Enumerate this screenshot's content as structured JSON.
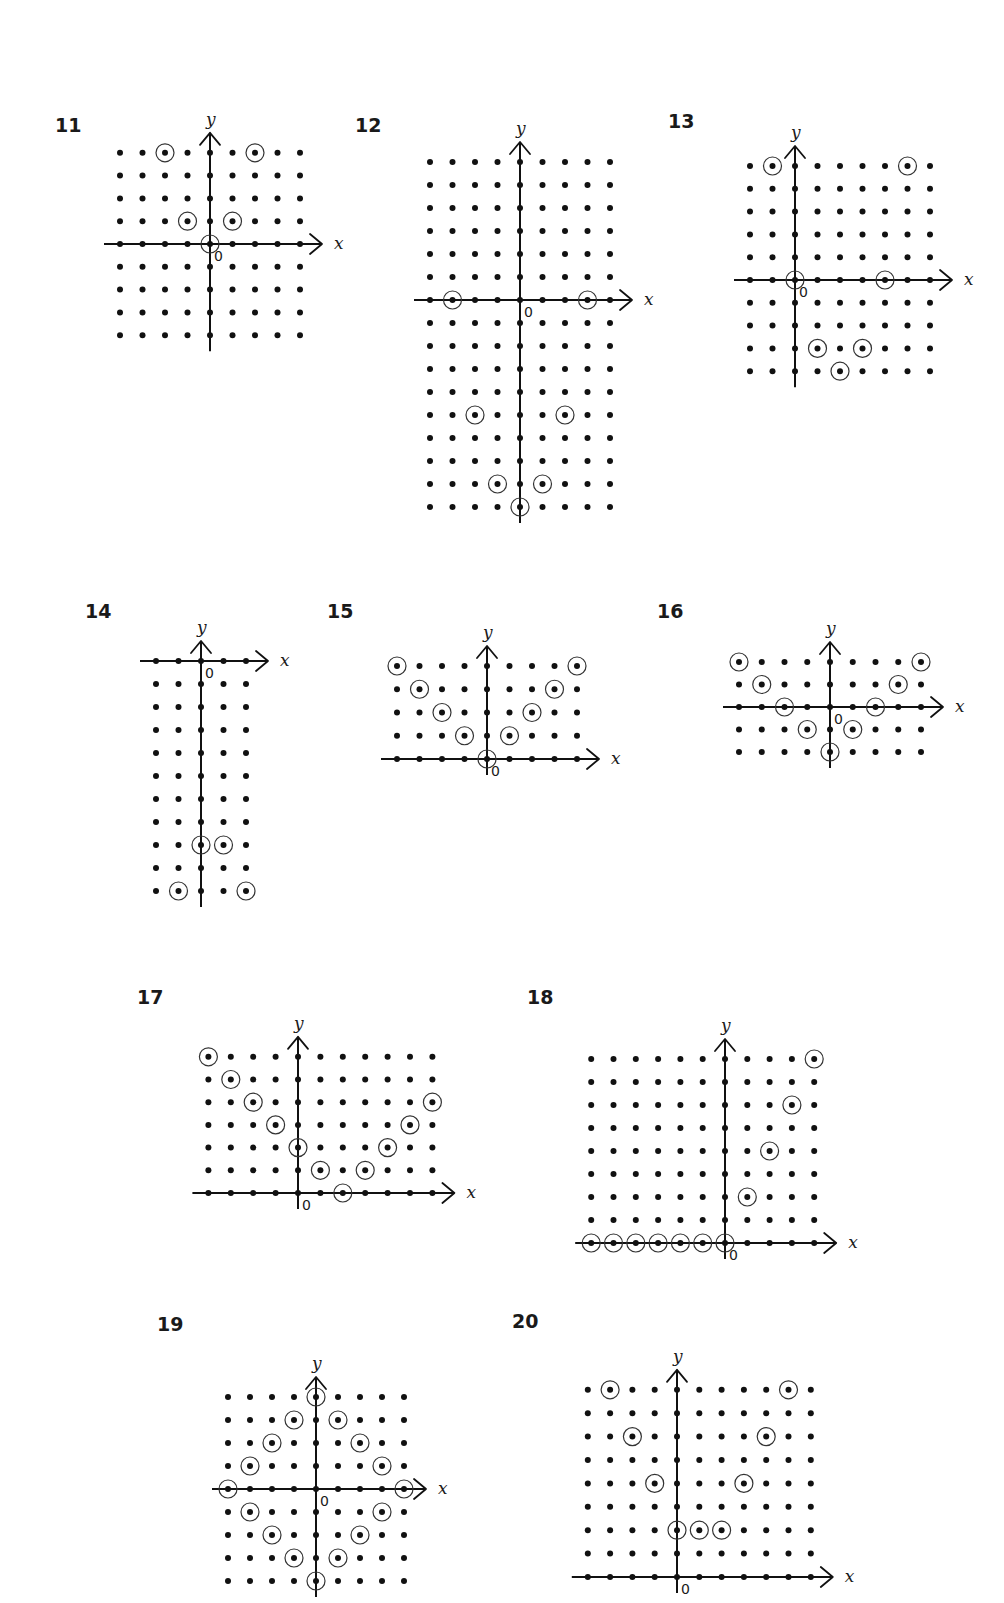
{
  "style": {
    "dot_color": "#111111",
    "ring_color": "#333333",
    "axis_color": "#111111",
    "background": "#ffffff"
  },
  "labels": {
    "x_axis": "x",
    "y_axis": "y",
    "origin": "0"
  },
  "diagrams": [
    {
      "number": "11",
      "label_pos": [
        55,
        132
      ],
      "origin_px": [
        210,
        244
      ],
      "spacing": [
        22.5,
        22.8
      ],
      "x_range": [
        -4,
        4
      ],
      "y_range": [
        -4,
        4
      ],
      "circled": [
        [
          -2,
          4
        ],
        [
          2,
          4
        ],
        [
          -1,
          1
        ],
        [
          1,
          1
        ],
        [
          0,
          0
        ]
      ]
    },
    {
      "number": "12",
      "label_pos": [
        355,
        132
      ],
      "origin_px": [
        520,
        300
      ],
      "spacing": [
        22.5,
        23
      ],
      "x_range": [
        -4,
        4
      ],
      "y_range": [
        -9,
        6
      ],
      "circled": [
        [
          -3,
          0
        ],
        [
          3,
          0
        ],
        [
          -2,
          -5
        ],
        [
          2,
          -5
        ],
        [
          -1,
          -8
        ],
        [
          1,
          -8
        ],
        [
          0,
          -9
        ]
      ]
    },
    {
      "number": "13",
      "label_pos": [
        668,
        128
      ],
      "origin_px": [
        795,
        280
      ],
      "spacing": [
        22.5,
        22.8
      ],
      "x_range": [
        -2,
        6
      ],
      "y_range": [
        -4,
        5
      ],
      "circled": [
        [
          -1,
          5
        ],
        [
          5,
          5
        ],
        [
          0,
          0
        ],
        [
          4,
          0
        ],
        [
          1,
          -3
        ],
        [
          3,
          -3
        ],
        [
          2,
          -4
        ]
      ]
    },
    {
      "number": "14",
      "label_pos": [
        85,
        618
      ],
      "origin_px": [
        201,
        661
      ],
      "spacing": [
        22.5,
        23
      ],
      "x_range": [
        -2,
        2
      ],
      "y_range": [
        -10,
        0
      ],
      "circled": [
        [
          0,
          -8
        ],
        [
          1,
          -8
        ],
        [
          -1,
          -10
        ],
        [
          2,
          -10
        ]
      ]
    },
    {
      "number": "15",
      "label_pos": [
        327,
        618
      ],
      "origin_px": [
        487,
        759
      ],
      "spacing": [
        22.5,
        23.25
      ],
      "x_range": [
        -4,
        4
      ],
      "y_range": [
        0,
        4
      ],
      "circled": [
        [
          -4,
          4
        ],
        [
          4,
          4
        ],
        [
          -3,
          3
        ],
        [
          3,
          3
        ],
        [
          -2,
          2
        ],
        [
          2,
          2
        ],
        [
          -1,
          1
        ],
        [
          1,
          1
        ],
        [
          0,
          0
        ]
      ]
    },
    {
      "number": "16",
      "label_pos": [
        657,
        618
      ],
      "origin_px": [
        830,
        707
      ],
      "spacing": [
        22.75,
        22.5
      ],
      "x_range": [
        -4,
        4
      ],
      "y_range": [
        -2,
        2
      ],
      "circled": [
        [
          -4,
          2
        ],
        [
          4,
          2
        ],
        [
          -3,
          1
        ],
        [
          3,
          1
        ],
        [
          -2,
          0
        ],
        [
          2,
          0
        ],
        [
          -1,
          -1
        ],
        [
          1,
          -1
        ],
        [
          0,
          -2
        ]
      ]
    },
    {
      "number": "17",
      "label_pos": [
        137,
        1004
      ],
      "origin_px": [
        298,
        1193
      ],
      "spacing": [
        22.4,
        22.7
      ],
      "x_range": [
        -4,
        6
      ],
      "y_range": [
        0,
        6
      ],
      "circled": [
        [
          -4,
          6
        ],
        [
          -3,
          5
        ],
        [
          -2,
          4
        ],
        [
          -1,
          3
        ],
        [
          0,
          2
        ],
        [
          1,
          1
        ],
        [
          2,
          0
        ],
        [
          3,
          1
        ],
        [
          4,
          2
        ],
        [
          5,
          3
        ],
        [
          6,
          4
        ]
      ]
    },
    {
      "number": "18",
      "label_pos": [
        527,
        1004
      ],
      "origin_px": [
        725,
        1243
      ],
      "spacing": [
        22.3,
        23
      ],
      "x_range": [
        -6,
        4
      ],
      "y_range": [
        0,
        8
      ],
      "circled": [
        [
          -6,
          0
        ],
        [
          -5,
          0
        ],
        [
          -4,
          0
        ],
        [
          -3,
          0
        ],
        [
          -2,
          0
        ],
        [
          -1,
          0
        ],
        [
          0,
          0
        ],
        [
          1,
          2
        ],
        [
          2,
          4
        ],
        [
          3,
          6
        ],
        [
          4,
          8
        ]
      ]
    },
    {
      "number": "19",
      "label_pos": [
        157,
        1331
      ],
      "origin_px": [
        316,
        1489
      ],
      "spacing": [
        22,
        23
      ],
      "x_range": [
        -4,
        4
      ],
      "y_range": [
        -4,
        4
      ],
      "circled": [
        [
          0,
          4
        ],
        [
          -1,
          3
        ],
        [
          1,
          3
        ],
        [
          -2,
          2
        ],
        [
          2,
          2
        ],
        [
          -3,
          1
        ],
        [
          3,
          1
        ],
        [
          -4,
          0
        ],
        [
          4,
          0
        ],
        [
          -3,
          -1
        ],
        [
          3,
          -1
        ],
        [
          -2,
          -2
        ],
        [
          2,
          -2
        ],
        [
          -1,
          -3
        ],
        [
          1,
          -3
        ],
        [
          0,
          -4
        ]
      ]
    },
    {
      "number": "20",
      "label_pos": [
        512,
        1328
      ],
      "origin_px": [
        677,
        1577
      ],
      "spacing": [
        22.3,
        23.4
      ],
      "x_range": [
        -4,
        6
      ],
      "y_range": [
        0,
        8
      ],
      "circled": [
        [
          -3,
          8
        ],
        [
          5,
          8
        ],
        [
          -2,
          6
        ],
        [
          4,
          6
        ],
        [
          -1,
          4
        ],
        [
          3,
          4
        ],
        [
          0,
          2
        ],
        [
          1,
          2
        ],
        [
          2,
          2
        ]
      ]
    }
  ]
}
